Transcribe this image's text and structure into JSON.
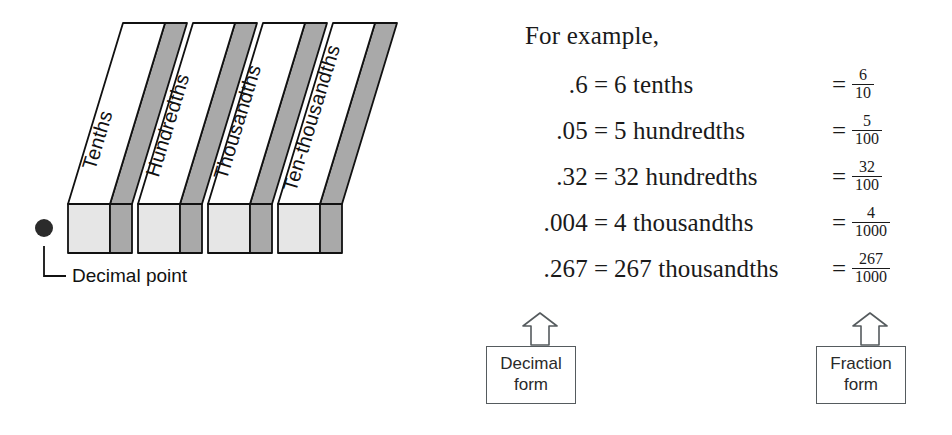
{
  "diagram": {
    "bars": [
      {
        "label": "Tenths"
      },
      {
        "label": "Hundredths"
      },
      {
        "label": "Thousandths"
      },
      {
        "label": "Ten-thousandths"
      }
    ],
    "decimal_point_label": "Decimal point",
    "colors": {
      "top_face": "#ffffff",
      "side_face": "#a9a9a9",
      "front_face": "#e6e6e6",
      "outline": "#111111",
      "dot": "#2b2b2b"
    }
  },
  "examples": {
    "heading": "For example,",
    "rows": [
      {
        "decimal": ".6",
        "eq1": "=",
        "words": "6 tenths",
        "eq2": "=",
        "numerator": "6",
        "denominator": "10"
      },
      {
        "decimal": ".05",
        "eq1": "=",
        "words": "5 hundredths",
        "eq2": "=",
        "numerator": "5",
        "denominator": "100"
      },
      {
        "decimal": ".32",
        "eq1": "=",
        "words": "32 hundredths",
        "eq2": "=",
        "numerator": "32",
        "denominator": "100"
      },
      {
        "decimal": ".004",
        "eq1": "=",
        "words": "4 thousandths",
        "eq2": "=",
        "numerator": "4",
        "denominator": "1000"
      },
      {
        "decimal": ".267",
        "eq1": "=",
        "words": "267 thousandths",
        "eq2": "=",
        "numerator": "267",
        "denominator": "1000"
      }
    ],
    "callouts": {
      "decimal": {
        "line1": "Decimal",
        "line2": "form"
      },
      "fraction": {
        "line1": "Fraction",
        "line2": "form"
      }
    }
  }
}
